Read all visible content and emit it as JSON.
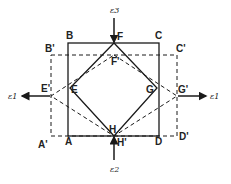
{
  "diagram": {
    "colors": {
      "line": "#1a1a1a",
      "background": "#ffffff"
    },
    "labels": {
      "B": "B",
      "C": "C",
      "A": "A",
      "D": "D",
      "B_prime": "B'",
      "C_prime": "C'",
      "A_prime": "A'",
      "D_prime": "D'",
      "F": "F",
      "F_prime": "F'",
      "H": "H",
      "H_prime": "H'",
      "E": "E",
      "E_prime": "E'",
      "G": "G",
      "G_prime": "G'"
    },
    "strain_labels": {
      "top": "ε3",
      "bottom": "ε2",
      "left": "ε1",
      "right": "ε1"
    },
    "shapes": {
      "solid_square": "ABCD",
      "dashed_rectangle": "A'B'C'D'",
      "solid_rhombus": "EFGH",
      "dashed_rhombus": "E'F'G'H'"
    }
  }
}
